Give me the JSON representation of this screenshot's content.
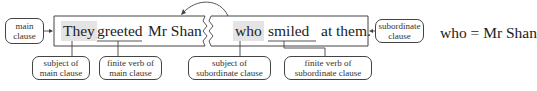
{
  "sentence": {
    "main_clause": {
      "words": [
        "They",
        "greeted",
        "Mr Shan"
      ],
      "subject": "They",
      "finite_verb": "greeted"
    },
    "subordinate_clause": {
      "words": [
        "who",
        "smiled",
        "at them."
      ],
      "subject": "who",
      "finite_verb": "smiled"
    }
  },
  "labels": {
    "main_clause": [
      "main",
      "clause"
    ],
    "subordinate_clause": [
      "subordinate",
      "clause"
    ],
    "subject_main": [
      "subject of",
      "main clause"
    ],
    "verb_main": [
      "finite verb of",
      "main clause"
    ],
    "subject_sub": [
      "subject of",
      "subordinate clause"
    ],
    "verb_sub": [
      "finite verb of",
      "subordinate clause"
    ]
  },
  "equation": "who = Mr Shan",
  "colors": {
    "highlight": "#e4e4e4",
    "stroke": "#444444"
  }
}
